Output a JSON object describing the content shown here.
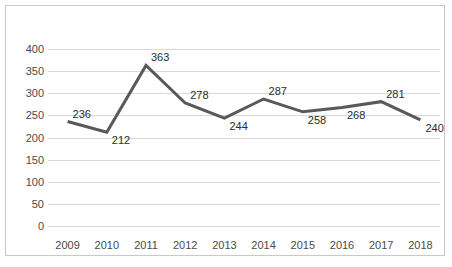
{
  "chart_data": {
    "type": "line",
    "title": "",
    "subtitle": "",
    "xlabel": "",
    "ylabel": "",
    "categories": [
      "2009",
      "2010",
      "2011",
      "2012",
      "2013",
      "2014",
      "2015",
      "2016",
      "2017",
      "2018"
    ],
    "values": [
      236,
      212,
      363,
      278,
      244,
      287,
      258,
      268,
      281,
      240
    ],
    "series": [
      {
        "name": "",
        "values": [
          236,
          212,
          363,
          278,
          244,
          287,
          258,
          268,
          281,
          240
        ]
      }
    ],
    "data_labels": [
      "236",
      "212",
      "363",
      "278",
      "244",
      "287",
      "258",
      "268",
      "281",
      "240"
    ],
    "ylim": [
      0,
      400
    ],
    "ytick_labels": [
      "400",
      "350",
      "300",
      "250",
      "200",
      "150",
      "100",
      "50",
      "0"
    ],
    "ytick_values": [
      400,
      350,
      300,
      250,
      200,
      150,
      100,
      50,
      0
    ],
    "grid": true,
    "grid_axis": "y",
    "legend": false,
    "legend_position": "none",
    "colors": {
      "line": "#595959",
      "grid": "#d9d9d9",
      "border": "#c9c9c9",
      "text": "#4a4a4a",
      "label_text": "#2b2b2b",
      "background": "#ffffff"
    },
    "line_width": 3,
    "markers": false
  }
}
